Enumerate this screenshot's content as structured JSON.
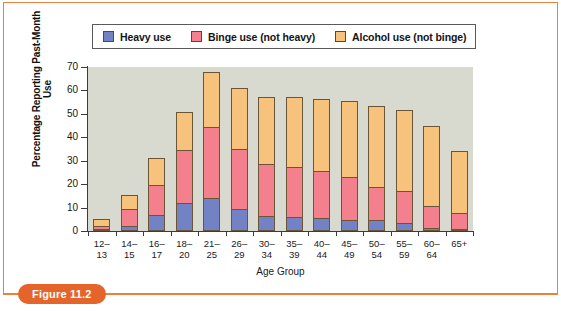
{
  "figure": {
    "tag_label": "Figure 11.2",
    "frame_color": "#E8823C"
  },
  "legend": {
    "position": "top",
    "items": [
      {
        "label": "Heavy use",
        "color": "#7382C4"
      },
      {
        "label": "Binge use (not heavy)",
        "color": "#F4808E"
      },
      {
        "label": "Alcohol use (not binge)",
        "color": "#F6C27C"
      }
    ]
  },
  "chart_data": {
    "type": "bar",
    "stacked": true,
    "title": "",
    "subtitle": "",
    "xlabel": "Age Group",
    "ylabel": "Percentage Reporting Past-Month Use",
    "ylim": [
      0,
      70
    ],
    "yticks": [
      0,
      10,
      20,
      30,
      40,
      50,
      60,
      70
    ],
    "grid": false,
    "plot_background": "#D8DACF",
    "legend_position": "top",
    "categories": [
      "12–13",
      "14–15",
      "16–17",
      "18–20",
      "21–25",
      "26–29",
      "30–34",
      "35–39",
      "40–44",
      "45–49",
      "50–54",
      "55–59",
      "60–64",
      "65+"
    ],
    "series": [
      {
        "name": "Heavy use",
        "color": "#7382C4",
        "values": [
          0.8,
          2.0,
          7.0,
          11.8,
          14.2,
          9.2,
          6.5,
          6.1,
          5.4,
          4.8,
          4.8,
          3.5,
          1.1,
          0.9
        ]
      },
      {
        "name": "Binge use (not heavy)",
        "color": "#F4808E",
        "values": [
          1.3,
          7.2,
          12.6,
          22.8,
          30.1,
          25.9,
          22.0,
          21.2,
          20.1,
          18.3,
          14.1,
          13.5,
          9.7,
          6.6
        ]
      },
      {
        "name": "Alcohol use (not binge)",
        "color": "#F6C27C",
        "values": [
          2.9,
          6.3,
          11.7,
          16.2,
          23.6,
          26.1,
          28.5,
          30.1,
          30.9,
          32.6,
          34.4,
          34.6,
          34.0,
          26.5
        ]
      }
    ],
    "totals": [
      5.0,
      15.5,
      31.3,
      50.8,
      67.9,
      61.2,
      57.0,
      57.4,
      56.4,
      55.7,
      53.3,
      51.6,
      44.8,
      34.0
    ]
  }
}
